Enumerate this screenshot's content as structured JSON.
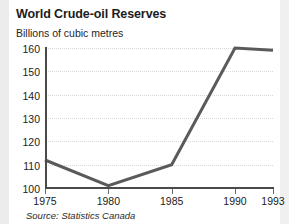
{
  "chart_data": {
    "type": "line",
    "title": "World Crude-oil Reserves",
    "subtitle": "Billions of cubic metres",
    "ylabel": "Billions of cubic metres",
    "xlabel": "",
    "source": "Source: Statistics Canada",
    "x": [
      1975,
      1980,
      1985,
      1990,
      1993
    ],
    "xtick_labels": [
      "1975",
      "1980",
      "1985",
      "1990",
      "1993"
    ],
    "values": [
      112,
      101,
      110,
      160,
      159
    ],
    "ytick_labels": [
      "100",
      "110",
      "120",
      "130",
      "140",
      "150",
      "160"
    ],
    "yticks": [
      100,
      110,
      120,
      130,
      140,
      150,
      160
    ],
    "ylim": [
      100,
      160
    ],
    "xlim": [
      1975,
      1993
    ],
    "grid": true,
    "legend": false,
    "series": [
      {
        "name": "World crude-oil reserves",
        "values": [
          112,
          101,
          110,
          160,
          159
        ]
      }
    ],
    "colors": {
      "line": "#5a5a5a",
      "axis": "#4a4a4a",
      "grid": "#d8d8d8",
      "text": "#1c1c1c",
      "background": "#ffffff"
    }
  }
}
